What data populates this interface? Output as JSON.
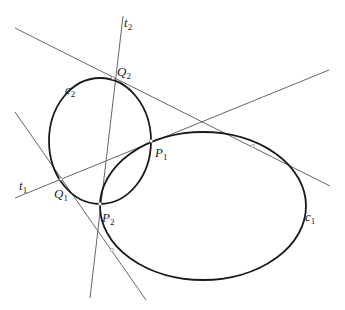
{
  "figure": {
    "curves": [
      {
        "id": "c1",
        "label": "c",
        "sub": "1",
        "cx": 203,
        "cy": 206,
        "rx": 103,
        "ry": 74
      },
      {
        "id": "c2",
        "label": "c",
        "sub": "2",
        "cx": 100,
        "cy": 141,
        "rx": 51,
        "ry": 63
      }
    ],
    "lines": [
      {
        "id": "t2",
        "label": "t",
        "sub": "2",
        "x1": 123,
        "y1": 16,
        "x2": 90,
        "y2": 298
      },
      {
        "id": "t1",
        "label": "t",
        "sub": "1",
        "x1": 15,
        "y1": 198,
        "x2": 329,
        "y2": 70
      },
      {
        "id": "tangent-q2",
        "label": "",
        "x1": 15,
        "y1": 28,
        "x2": 330,
        "y2": 186
      },
      {
        "id": "tangent-q1",
        "label": "",
        "x1": 15,
        "y1": 112,
        "x2": 146,
        "y2": 300
      }
    ],
    "points": [
      {
        "id": "Q2",
        "label": "Q",
        "sub": "2",
        "x": 113,
        "y": 78
      },
      {
        "id": "P1",
        "label": "P",
        "sub": "1",
        "x": 151,
        "y": 141
      },
      {
        "id": "Q1",
        "label": "Q",
        "sub": "1",
        "x": 61,
        "y": 179
      },
      {
        "id": "P2",
        "label": "P",
        "sub": "2",
        "x": 100,
        "y": 204
      },
      {
        "id": "T1",
        "label": "",
        "x": 253,
        "y": 146
      },
      {
        "id": "T2",
        "label": "",
        "x": 112,
        "y": 250
      }
    ],
    "labels": {
      "t2": {
        "main": "t",
        "sub": "2"
      },
      "t1": {
        "main": "t",
        "sub": "1"
      },
      "Q2": {
        "main": "Q",
        "sub": "2"
      },
      "c2": {
        "main": "c",
        "sub": "2"
      },
      "P1": {
        "main": "P",
        "sub": "1"
      },
      "Q1": {
        "main": "Q",
        "sub": "1"
      },
      "P2": {
        "main": "P",
        "sub": "2"
      },
      "c1": {
        "main": "c",
        "sub": "1"
      }
    }
  }
}
